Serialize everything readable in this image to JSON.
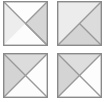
{
  "figure": {
    "grid": {
      "columns": 2,
      "rows": 2,
      "tile_count": 4
    }
  },
  "palette": {
    "white": "#fdfdfd",
    "light_gray": "#e9e9e9",
    "mid_gray": "#d8d8d8",
    "dark_gray": "#cfcfcf",
    "outline": "#8a8a8a",
    "inner_line": "#9a9a9a",
    "background": "#ffffff"
  },
  "tiles": [
    {
      "id": "tile-1",
      "position": "top-left",
      "regions": [
        {
          "name": "top-triangle",
          "points": "0,0 45,0 22.5,22.5",
          "fill": "#fdfdfd"
        },
        {
          "name": "left-triangle",
          "points": "0,0 22.5,22.5 0,45",
          "fill": "#ededed"
        },
        {
          "name": "right-triangle",
          "points": "45,0 45,45 22.5,22.5",
          "fill": "#d6d6d6"
        },
        {
          "name": "bottom-triangle",
          "points": "0,45 22.5,22.5 45,45",
          "fill": "#fcfcfc"
        }
      ],
      "lines": [
        {
          "name": "main-diagonal",
          "x1": 0,
          "y1": 0,
          "x2": 45,
          "y2": 45
        },
        {
          "name": "anti-diagonal-upper",
          "x1": 45,
          "y1": 0,
          "x2": 22.5,
          "y2": 22.5
        },
        {
          "name": "anti-diagonal-lower",
          "x1": 22.5,
          "y1": 22.5,
          "x2": 45,
          "y2": 45
        }
      ]
    },
    {
      "id": "tile-2",
      "position": "top-right",
      "regions": [
        {
          "name": "upper-left-triangle",
          "points": "0,0 45,0 0,45",
          "fill": "#ececec"
        },
        {
          "name": "lower-right-triangle",
          "points": "45,0 45,45 0,45",
          "fill": "#d4d4d4"
        },
        {
          "name": "inner-wedge",
          "points": "45,0 45,45 22.5,22.5",
          "fill": "#dcdcdc"
        }
      ],
      "lines": [
        {
          "name": "anti-diagonal",
          "x1": 45,
          "y1": 0,
          "x2": 0,
          "y2": 45
        },
        {
          "name": "main-diagonal-lower",
          "x1": 22.5,
          "y1": 22.5,
          "x2": 45,
          "y2": 45
        }
      ]
    },
    {
      "id": "tile-3",
      "position": "bottom-left",
      "regions": [
        {
          "name": "top-triangle",
          "points": "0,0 45,0 22.5,22.5",
          "fill": "#dcdcdc"
        },
        {
          "name": "left-triangle",
          "points": "0,0 22.5,22.5 0,45",
          "fill": "#d4d4d4"
        },
        {
          "name": "right-triangle",
          "points": "45,0 45,45 22.5,22.5",
          "fill": "#fdfdfd"
        },
        {
          "name": "bottom-triangle",
          "points": "0,45 22.5,22.5 45,45",
          "fill": "#fcfcfc"
        }
      ],
      "lines": [
        {
          "name": "main-diagonal",
          "x1": 0,
          "y1": 0,
          "x2": 45,
          "y2": 45
        },
        {
          "name": "anti-diagonal-upper",
          "x1": 45,
          "y1": 0,
          "x2": 22.5,
          "y2": 22.5
        },
        {
          "name": "anti-diagonal-lower",
          "x1": 22.5,
          "y1": 22.5,
          "x2": 0,
          "y2": 45
        }
      ]
    },
    {
      "id": "tile-4",
      "position": "bottom-right",
      "regions": [
        {
          "name": "top-triangle",
          "points": "0,0 45,0 22.5,22.5",
          "fill": "#dedede"
        },
        {
          "name": "left-triangle",
          "points": "0,0 22.5,22.5 0,45",
          "fill": "#d4d4d4"
        },
        {
          "name": "right-triangle",
          "points": "45,0 45,45 22.5,22.5",
          "fill": "#fdfdfd"
        },
        {
          "name": "bottom-triangle",
          "points": "0,45 22.5,22.5 45,45",
          "fill": "#fdfdfd"
        }
      ],
      "lines": [
        {
          "name": "main-diagonal",
          "x1": 0,
          "y1": 0,
          "x2": 45,
          "y2": 45
        },
        {
          "name": "anti-diagonal",
          "x1": 45,
          "y1": 0,
          "x2": 0,
          "y2": 45
        }
      ]
    }
  ]
}
